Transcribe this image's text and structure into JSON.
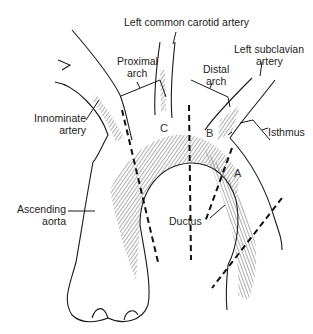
{
  "figure": {
    "type": "anatomical line drawing",
    "colors": {
      "ink": "#1a1a1a",
      "hatch": "#555555",
      "background": "#ffffff"
    }
  },
  "labels": {
    "left_common_carotid": "Left common carotid artery",
    "proximal_arch_1": "Proximal",
    "proximal_arch_2": "arch",
    "distal_arch_1": "Distal",
    "distal_arch_2": "arch",
    "left_subclavian_1": "Left subclavian",
    "left_subclavian_2": "artery",
    "innominate_1": "Innominate",
    "innominate_2": "artery",
    "isthmus": "Isthmus",
    "ascending_aorta_1": "Ascending",
    "ascending_aorta_2": "aorta",
    "ductus": "Ductus"
  },
  "zones": {
    "a": "A",
    "b": "B",
    "c": "C"
  }
}
